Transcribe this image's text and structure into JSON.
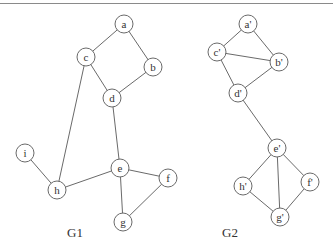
{
  "diagram": {
    "type": "graph-comparison",
    "node_radius": 9,
    "colors": {
      "stroke": "#6a6a6a",
      "text": "#333333",
      "background": "#ffffff"
    },
    "graphs": [
      {
        "label": "G1",
        "label_pos": [
          75,
          237
        ],
        "nodes": [
          {
            "id": "a",
            "label": "a",
            "x": 124,
            "y": 24
          },
          {
            "id": "b",
            "label": "b",
            "x": 153,
            "y": 67
          },
          {
            "id": "c",
            "label": "c",
            "x": 86,
            "y": 57
          },
          {
            "id": "d",
            "label": "d",
            "x": 112,
            "y": 98
          },
          {
            "id": "e",
            "label": "e",
            "x": 120,
            "y": 168
          },
          {
            "id": "f",
            "label": "f",
            "x": 168,
            "y": 178
          },
          {
            "id": "g",
            "label": "g",
            "x": 123,
            "y": 222
          },
          {
            "id": "h",
            "label": "h",
            "x": 57,
            "y": 190
          },
          {
            "id": "i",
            "label": "i",
            "x": 25,
            "y": 153
          }
        ],
        "edges": [
          [
            "a",
            "c"
          ],
          [
            "a",
            "b"
          ],
          [
            "c",
            "d"
          ],
          [
            "b",
            "d"
          ],
          [
            "c",
            "h"
          ],
          [
            "d",
            "e"
          ],
          [
            "i",
            "h"
          ],
          [
            "h",
            "e"
          ],
          [
            "e",
            "f"
          ],
          [
            "e",
            "g"
          ],
          [
            "f",
            "g"
          ]
        ]
      },
      {
        "label": "G2",
        "label_pos": [
          230,
          237
        ],
        "nodes": [
          {
            "id": "a2",
            "label": "a'",
            "x": 248,
            "y": 24
          },
          {
            "id": "b2",
            "label": "b'",
            "x": 279,
            "y": 62
          },
          {
            "id": "c2",
            "label": "c'",
            "x": 217,
            "y": 52
          },
          {
            "id": "d2",
            "label": "d'",
            "x": 238,
            "y": 93
          },
          {
            "id": "e2",
            "label": "e'",
            "x": 277,
            "y": 148
          },
          {
            "id": "f2",
            "label": "f'",
            "x": 310,
            "y": 182
          },
          {
            "id": "g2",
            "label": "g'",
            "x": 280,
            "y": 217
          },
          {
            "id": "h2",
            "label": "h'",
            "x": 243,
            "y": 186
          }
        ],
        "edges": [
          [
            "a2",
            "c2"
          ],
          [
            "a2",
            "b2"
          ],
          [
            "c2",
            "b2"
          ],
          [
            "c2",
            "d2"
          ],
          [
            "b2",
            "d2"
          ],
          [
            "d2",
            "e2"
          ],
          [
            "e2",
            "h2"
          ],
          [
            "e2",
            "g2"
          ],
          [
            "e2",
            "f2"
          ],
          [
            "h2",
            "g2"
          ],
          [
            "f2",
            "g2"
          ]
        ]
      }
    ]
  }
}
